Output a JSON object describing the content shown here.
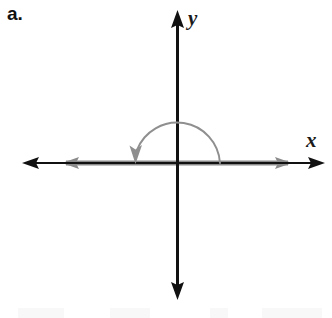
{
  "figure": {
    "part_label": "a.",
    "background_color": "#ffffff",
    "width": 332,
    "height": 318
  },
  "axes": {
    "x_axis": {
      "label": "x",
      "color": "#111111",
      "origin_x": 177,
      "origin_y": 163,
      "left_tip_x": 22,
      "right_tip_x": 325,
      "stroke_width": 2.2,
      "arrow_left": "arrow-left",
      "arrow_right": "arrow-right"
    },
    "y_axis": {
      "label": "y",
      "color": "#111111",
      "origin_x": 177,
      "top_tip_y": 10,
      "bottom_tip_y": 300,
      "stroke_width": 3.0,
      "arrow_up": "arrow-up",
      "arrow_down": "arrow-down"
    }
  },
  "angle": {
    "measure_degrees": 180,
    "direction": "counterclockwise",
    "color": "#8a8a8a",
    "initial_side": {
      "name": "initial-side-ray",
      "from_x": 177,
      "to_x": 292,
      "y": 163,
      "arrow": "arrow-right"
    },
    "terminal_side": {
      "name": "terminal-side-ray",
      "from_x": 177,
      "to_x": 62,
      "y": 163,
      "arrow": "arrow-left"
    },
    "ray_stroke_width": 5,
    "arc": {
      "name": "rotation-arc",
      "center_x": 177,
      "center_y": 163,
      "radius": 43,
      "start_x": 220,
      "start_y": 163,
      "end_x": 136,
      "end_y": 163,
      "sweep": "over-the-top",
      "stroke_width": 2,
      "arrow_at": "end",
      "arrow_direction": "down"
    }
  },
  "colors": {
    "axis_black": "#111111",
    "angle_gray": "#8a8a8a",
    "arc_gray": "#8f8f8f",
    "page_white": "#ffffff",
    "noise_gray": "#f2f2f2"
  }
}
